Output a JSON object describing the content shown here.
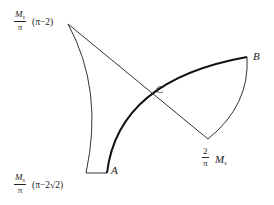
{
  "diagram": {
    "points": {
      "A": "A",
      "B": "B",
      "C": "C"
    },
    "labels": {
      "top_left": {
        "num": "M",
        "sub": "s",
        "den": "π",
        "expr": "(π−2)"
      },
      "bottom_left": {
        "num": "M",
        "sub": "s",
        "den": "π",
        "expr": "(π−2√2)"
      },
      "bottom_right": {
        "num": "2",
        "den": "π",
        "expr": "M",
        "sub": "s"
      }
    },
    "colors": {
      "stroke": "#222222",
      "background": "#ffffff"
    }
  }
}
